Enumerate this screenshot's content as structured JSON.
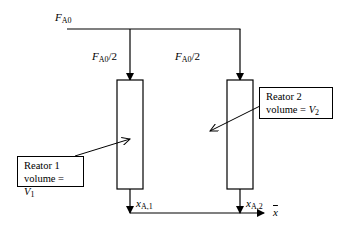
{
  "diagram": {
    "feed": {
      "symbol": "F",
      "subscript": "A0"
    },
    "split_left": {
      "symbol": "F",
      "subscript": "A0",
      "suffix": "/2"
    },
    "split_right": {
      "symbol": "F",
      "subscript": "A0",
      "suffix": "/2"
    },
    "reactor1": {
      "name": "Reator 1",
      "volume_prefix": "volume = ",
      "volume_symbol": "V",
      "volume_subscript": "1"
    },
    "reactor2": {
      "name": "Reator 2",
      "volume_prefix": "volume = ",
      "volume_symbol": "V",
      "volume_subscript": "2"
    },
    "outlet1": {
      "symbol": "x",
      "subscript": "A,1"
    },
    "outlet2": {
      "symbol": "x",
      "subscript": "A,2"
    },
    "mixed_outlet": {
      "symbol": "x"
    }
  }
}
